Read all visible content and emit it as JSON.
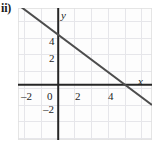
{
  "part_label": "ii)",
  "chart_data": {
    "type": "line",
    "title": "",
    "xlabel": "x",
    "ylabel": "y",
    "xlim": [
      -2.4,
      5.6
    ],
    "ylim": [
      -3.3,
      4.6
    ],
    "grid": true,
    "legend": "none",
    "x_ticks": [
      {
        "value": -2,
        "label": "–2"
      },
      {
        "value": 0,
        "label": "0"
      },
      {
        "value": 2,
        "label": "2"
      },
      {
        "value": 4,
        "label": "4"
      }
    ],
    "y_ticks": [
      {
        "value": 4,
        "label": "4"
      },
      {
        "value": 2,
        "label": "2"
      },
      {
        "value": -2,
        "label": "–2"
      }
    ],
    "series": [
      {
        "name": "line",
        "equation": "y = -0.75x + 3",
        "slope": -0.75,
        "y_intercept": 3,
        "x_intercept": 4,
        "points": [
          [
            -2.4,
            4.8
          ],
          [
            5.6,
            -1.2
          ]
        ]
      }
    ],
    "colors": {
      "line": "#4d4d4d",
      "axis": "#262626",
      "grid": "#e6e6ea",
      "background": "#fdfdfd"
    }
  },
  "axis_labels": {
    "x": "x",
    "y": "y"
  },
  "tick_text": {
    "x_neg2": "–2",
    "x_zero": "0",
    "x_2": "2",
    "x_4": "4",
    "y_4": "4",
    "y_2": "2",
    "y_neg2": "–2"
  }
}
